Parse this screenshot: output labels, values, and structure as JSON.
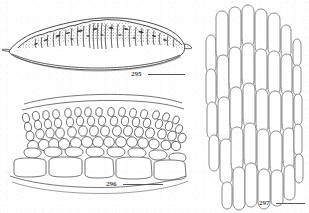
{
  "plate": {
    "background_color": "#fefefe",
    "ink_color": "#3a3a3a",
    "label_color": "#4a4a4a",
    "figures": [
      {
        "number": "295",
        "caption_label": "295",
        "subject": "lens-shaped ascoma in vertical section, densely stippled upper surface",
        "scale_bar": true,
        "position": "top-left"
      },
      {
        "number": "296",
        "caption_label": "296",
        "subject": "hymenium in vertical section showing basal cells, subhymenial cells and chains of terminal cells",
        "scale_bar": true,
        "position": "bottom-left"
      },
      {
        "number": "297",
        "caption_label": "297",
        "subject": "elongate hyphal cells arranged in vertical rows",
        "scale_bar": true,
        "position": "right"
      }
    ]
  }
}
